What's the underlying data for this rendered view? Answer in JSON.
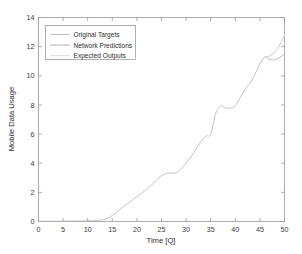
{
  "chart_data": {
    "type": "line",
    "title": "",
    "xlabel": "Time [Q]",
    "ylabel": "Mobile Data Usage",
    "xlim": [
      0,
      50
    ],
    "ylim": [
      0,
      14
    ],
    "xticks": [
      0,
      5,
      10,
      15,
      20,
      25,
      30,
      35,
      40,
      45,
      50
    ],
    "yticks": [
      0,
      2,
      4,
      6,
      8,
      10,
      12,
      14
    ],
    "grid": false,
    "legend_position": "upper left",
    "legend": [
      "Original Targets",
      "Network Predictions",
      "Expected Outputs"
    ],
    "series": [
      {
        "name": "Original Targets",
        "color": "#b9b9b9",
        "x": [
          0,
          1,
          2,
          3,
          4,
          5,
          6,
          7,
          8,
          9,
          10,
          11,
          12,
          13,
          14,
          15,
          16,
          17,
          18,
          19,
          20,
          21,
          22,
          23,
          24,
          25,
          26,
          27,
          28,
          29,
          30,
          31,
          32,
          33,
          34,
          35,
          36,
          37,
          38,
          39,
          40,
          41,
          42,
          43,
          44,
          45
        ],
        "values": [
          0.02,
          0.02,
          0.02,
          0.02,
          0.02,
          0.02,
          0.03,
          0.03,
          0.03,
          0.04,
          0.05,
          0.06,
          0.08,
          0.12,
          0.22,
          0.42,
          0.68,
          0.95,
          1.2,
          1.45,
          1.7,
          1.95,
          2.2,
          2.5,
          2.85,
          3.15,
          3.3,
          3.32,
          3.35,
          3.62,
          4.0,
          4.45,
          4.95,
          5.45,
          5.85,
          6.0,
          7.4,
          7.92,
          7.8,
          7.78,
          7.95,
          8.5,
          9.1,
          9.5,
          10.1,
          10.85
        ]
      },
      {
        "name": "Network Predictions",
        "color": "#aeaeae",
        "x": [
          45,
          46,
          47,
          48,
          49,
          50
        ],
        "values": [
          10.85,
          11.3,
          11.12,
          11.1,
          11.25,
          11.5
        ]
      },
      {
        "name": "Expected Outputs",
        "color": "#d8d8d8",
        "x": [
          45,
          46,
          47,
          48,
          49,
          50
        ],
        "values": [
          10.85,
          11.3,
          11.35,
          11.62,
          12.1,
          12.82
        ]
      }
    ]
  },
  "axes": {
    "x_tick_labels": [
      "0",
      "5",
      "10",
      "15",
      "20",
      "25",
      "30",
      "35",
      "40",
      "45",
      "50"
    ],
    "y_tick_labels": [
      "0",
      "2",
      "4",
      "6",
      "8",
      "10",
      "12",
      "14"
    ],
    "xlabel": "Time [Q]",
    "ylabel": "Mobile Data Usage"
  },
  "legend": {
    "items": [
      {
        "label": "Original Targets",
        "color": "#b9b9b9"
      },
      {
        "label": "Network Predictions",
        "color": "#aeaeae"
      },
      {
        "label": "Expected Outputs",
        "color": "#d8d8d8"
      }
    ]
  },
  "colors": {
    "background": "#ffffff",
    "axis": "#9a9a9a",
    "text": "#2e2e2e"
  }
}
